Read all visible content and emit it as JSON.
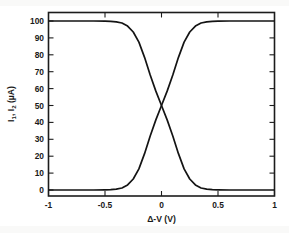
{
  "chart_data": {
    "type": "line",
    "title": "",
    "subtitle": "",
    "xlabel": "Δ-V (V)",
    "ylabel": "I₁, I₂ (µA)",
    "ylabel_parts": {
      "i": "I",
      "sub1": "1",
      "comma": ", ",
      "sub2": "2",
      "units": " (µA)"
    },
    "xlim": [
      -1,
      1
    ],
    "ylim": [
      0,
      100
    ],
    "xticks": [
      -1,
      -0.5,
      0,
      0.5,
      1
    ],
    "xtick_labels": [
      "-1",
      "-0.5",
      "0",
      "0.5",
      "1"
    ],
    "yticks": [
      0,
      10,
      20,
      30,
      40,
      50,
      60,
      70,
      80,
      90,
      100
    ],
    "ytick_labels": [
      "0",
      "10",
      "20",
      "30",
      "40",
      "50",
      "60",
      "70",
      "80",
      "90",
      "100"
    ],
    "grid": false,
    "legend": false,
    "legend_position": "none",
    "line_color": "#141414",
    "crossing_point": {
      "x": 0,
      "y": 50
    },
    "annotations": [],
    "series": [
      {
        "name": "I1",
        "description": "descending sigmoid, 100 µA at Δ-V = -1 V falling to 0 µA at Δ-V = +1 V, crossing 50 µA at Δ-V = 0",
        "x": [
          -1.0,
          -0.9,
          -0.8,
          -0.7,
          -0.6,
          -0.5,
          -0.45,
          -0.4,
          -0.35,
          -0.3,
          -0.25,
          -0.2,
          -0.15,
          -0.1,
          -0.05,
          0.0,
          0.05,
          0.1,
          0.15,
          0.2,
          0.25,
          0.3,
          0.35,
          0.4,
          0.45,
          0.5,
          0.6,
          0.7,
          0.8,
          0.9,
          1.0
        ],
        "values": [
          100.0,
          100.0,
          100.0,
          100.0,
          100.0,
          99.9,
          99.8,
          99.5,
          98.8,
          97.0,
          93.5,
          87.5,
          78.5,
          68.0,
          58.5,
          50.0,
          41.5,
          32.0,
          21.5,
          12.5,
          6.5,
          3.0,
          1.2,
          0.5,
          0.2,
          0.1,
          0.0,
          0.0,
          0.0,
          0.0,
          0.0
        ]
      },
      {
        "name": "I2",
        "description": "ascending sigmoid, 0 µA at Δ-V = -1 V rising to 100 µA at Δ-V = +1 V, crossing 50 µA at Δ-V = 0",
        "x": [
          -1.0,
          -0.9,
          -0.8,
          -0.7,
          -0.6,
          -0.5,
          -0.45,
          -0.4,
          -0.35,
          -0.3,
          -0.25,
          -0.2,
          -0.15,
          -0.1,
          -0.05,
          0.0,
          0.05,
          0.1,
          0.15,
          0.2,
          0.25,
          0.3,
          0.35,
          0.4,
          0.45,
          0.5,
          0.6,
          0.7,
          0.8,
          0.9,
          1.0
        ],
        "values": [
          0.0,
          0.0,
          0.0,
          0.0,
          0.0,
          0.1,
          0.2,
          0.5,
          1.2,
          3.0,
          6.5,
          12.5,
          21.5,
          32.0,
          41.5,
          50.0,
          58.5,
          68.0,
          78.5,
          87.5,
          93.5,
          97.0,
          98.8,
          99.5,
          99.8,
          99.9,
          100.0,
          100.0,
          100.0,
          100.0,
          100.0
        ]
      }
    ]
  }
}
